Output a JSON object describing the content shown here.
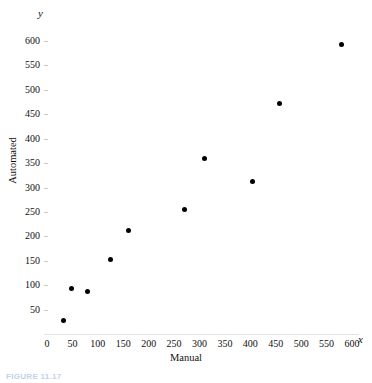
{
  "figure": {
    "caption": "FIGURE 11.17",
    "background_color": "#ffffff",
    "point_color": "#000000",
    "axis_color": "#e2e2e4"
  },
  "chart_data": {
    "type": "scatter",
    "title": "",
    "subtitle": "",
    "xlabel": "Manual",
    "ylabel": "Automated",
    "x_variable_symbol": "x",
    "y_variable_symbol": "y",
    "xlim": [
      0,
      600
    ],
    "ylim": [
      0,
      600
    ],
    "xticks": [
      0,
      50,
      100,
      150,
      200,
      250,
      300,
      350,
      400,
      450,
      500,
      550,
      600
    ],
    "yticks": [
      50,
      100,
      150,
      200,
      250,
      300,
      350,
      400,
      450,
      500,
      550,
      600
    ],
    "xtick_labels": [
      "0",
      "50",
      "100",
      "150",
      "200",
      "250",
      "300",
      "350",
      "400",
      "450",
      "500",
      "550",
      "600"
    ],
    "ytick_labels": [
      "50",
      "100",
      "150",
      "200",
      "250",
      "300",
      "350",
      "400",
      "450",
      "500",
      "550",
      "600"
    ],
    "grid": false,
    "legend": false,
    "legend_position": "none",
    "series": [
      {
        "name": "Manual vs Automated",
        "marker": "filled-circle",
        "color": "#000000",
        "points": [
          {
            "x": 33,
            "y": 28
          },
          {
            "x": 48,
            "y": 93
          },
          {
            "x": 80,
            "y": 88
          },
          {
            "x": 124,
            "y": 152
          },
          {
            "x": 160,
            "y": 211
          },
          {
            "x": 270,
            "y": 255
          },
          {
            "x": 310,
            "y": 360
          },
          {
            "x": 405,
            "y": 312
          },
          {
            "x": 457,
            "y": 473
          },
          {
            "x": 580,
            "y": 592
          }
        ]
      }
    ]
  }
}
